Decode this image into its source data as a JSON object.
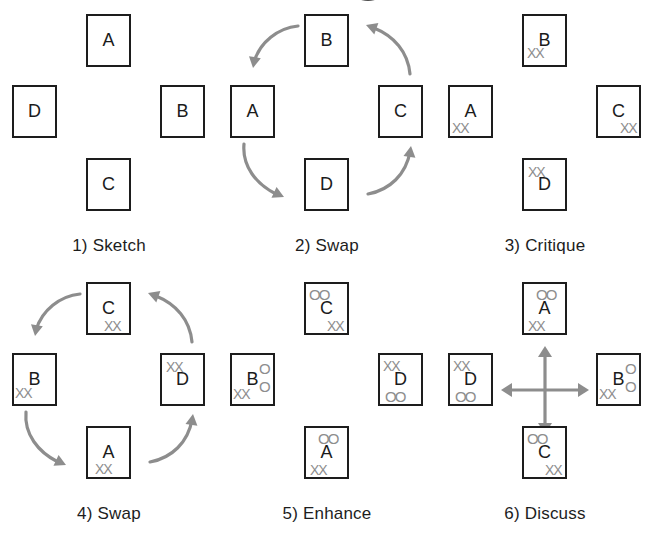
{
  "figure": {
    "title_fragment": "",
    "background": "#ffffff",
    "ink": "#1d1d1d",
    "annotation_color": "#8d8d8d",
    "panel_count": 6,
    "grid": {
      "columns": 3,
      "rows": 2
    }
  },
  "legend": {
    "x_mark": "XX",
    "o_mark": "OO",
    "x_meaning": "critique-marks",
    "o_meaning": "enhancement-marks"
  },
  "panels": [
    {
      "number": "1)",
      "name": "Sketch",
      "caption": "1) Sketch",
      "has_rotation_arrows": false,
      "has_discuss_cross": false,
      "cards": [
        {
          "slot": "top",
          "letter": "A",
          "marks": []
        },
        {
          "slot": "left",
          "letter": "D",
          "marks": []
        },
        {
          "slot": "right",
          "letter": "B",
          "marks": []
        },
        {
          "slot": "bottom",
          "letter": "C",
          "marks": []
        }
      ]
    },
    {
      "number": "2)",
      "name": "Swap",
      "caption": "2) Swap",
      "has_rotation_arrows": true,
      "has_discuss_cross": false,
      "cards": [
        {
          "slot": "top",
          "letter": "B",
          "marks": []
        },
        {
          "slot": "left",
          "letter": "A",
          "marks": []
        },
        {
          "slot": "right",
          "letter": "C",
          "marks": []
        },
        {
          "slot": "bottom",
          "letter": "D",
          "marks": []
        }
      ]
    },
    {
      "number": "3)",
      "name": "Critique",
      "caption": "3) Critique",
      "has_rotation_arrows": false,
      "has_discuss_cross": false,
      "cards": [
        {
          "slot": "top",
          "letter": "B",
          "marks": [
            {
              "text": "XX",
              "type": "x",
              "x": 3,
              "y": 30
            }
          ]
        },
        {
          "slot": "left",
          "letter": "A",
          "marks": [
            {
              "text": "XX",
              "type": "x",
              "x": 2,
              "y": 34
            }
          ]
        },
        {
          "slot": "right",
          "letter": "C",
          "marks": [
            {
              "text": "XX",
              "type": "x",
              "x": 22,
              "y": 34
            }
          ]
        },
        {
          "slot": "bottom",
          "letter": "D",
          "marks": [
            {
              "text": "XX",
              "type": "x",
              "x": 4,
              "y": 5
            }
          ]
        }
      ]
    },
    {
      "number": "4)",
      "name": "Swap",
      "caption": "4) Swap",
      "has_rotation_arrows": true,
      "has_discuss_cross": false,
      "cards": [
        {
          "slot": "top",
          "letter": "C",
          "marks": [
            {
              "text": "XX",
              "type": "x",
              "x": 16,
              "y": 35
            }
          ]
        },
        {
          "slot": "left",
          "letter": "B",
          "marks": [
            {
              "text": "XX",
              "type": "x",
              "x": 1,
              "y": 31
            }
          ]
        },
        {
          "slot": "right",
          "letter": "D",
          "marks": [
            {
              "text": "XX",
              "type": "x",
              "x": 4,
              "y": 5
            }
          ]
        },
        {
          "slot": "bottom",
          "letter": "A",
          "marks": [
            {
              "text": "XX",
              "type": "x",
              "x": 7,
              "y": 34
            }
          ]
        }
      ]
    },
    {
      "number": "5)",
      "name": "Enhance",
      "caption": "5) Enhance",
      "has_rotation_arrows": false,
      "has_discuss_cross": false,
      "cards": [
        {
          "slot": "top",
          "letter": "C",
          "marks": [
            {
              "text": "OO",
              "type": "o",
              "x": 3,
              "y": 3
            },
            {
              "text": "XX",
              "type": "x",
              "x": 21,
              "y": 35
            }
          ]
        },
        {
          "slot": "left",
          "letter": "B",
          "marks": [
            {
              "text": "O",
              "type": "o",
              "x": 27,
              "y": 6
            },
            {
              "text": "O",
              "type": "o",
              "x": 27,
              "y": 24
            },
            {
              "text": "XX",
              "type": "x",
              "x": 1,
              "y": 32
            }
          ]
        },
        {
          "slot": "right",
          "letter": "D",
          "marks": [
            {
              "text": "XX",
              "type": "x",
              "x": 3,
              "y": 4
            },
            {
              "text": "OO",
              "type": "o",
              "x": 5,
              "y": 34
            }
          ]
        },
        {
          "slot": "bottom",
          "letter": "A",
          "marks": [
            {
              "text": "OO",
              "type": "o",
              "x": 12,
              "y": 3
            },
            {
              "text": "XX",
              "type": "x",
              "x": 4,
              "y": 35
            }
          ]
        }
      ]
    },
    {
      "number": "6)",
      "name": "Discuss",
      "caption": "6) Discuss",
      "has_rotation_arrows": false,
      "has_discuss_cross": true,
      "cards": [
        {
          "slot": "top",
          "letter": "A",
          "marks": [
            {
              "text": "OO",
              "type": "o",
              "x": 12,
              "y": 3
            },
            {
              "text": "XX",
              "type": "x",
              "x": 4,
              "y": 35
            }
          ]
        },
        {
          "slot": "left",
          "letter": "D",
          "marks": [
            {
              "text": "XX",
              "type": "x",
              "x": 3,
              "y": 4
            },
            {
              "text": "OO",
              "type": "o",
              "x": 5,
              "y": 34
            }
          ]
        },
        {
          "slot": "right",
          "letter": "B",
          "marks": [
            {
              "text": "O",
              "type": "o",
              "x": 27,
              "y": 6
            },
            {
              "text": "O",
              "type": "o",
              "x": 27,
              "y": 24
            },
            {
              "text": "XX",
              "type": "x",
              "x": 1,
              "y": 32
            }
          ]
        },
        {
          "slot": "bottom",
          "letter": "C",
          "marks": [
            {
              "text": "OO",
              "type": "o",
              "x": 3,
              "y": 3
            },
            {
              "text": "XX",
              "type": "x",
              "x": 21,
              "y": 35
            }
          ]
        }
      ]
    }
  ]
}
